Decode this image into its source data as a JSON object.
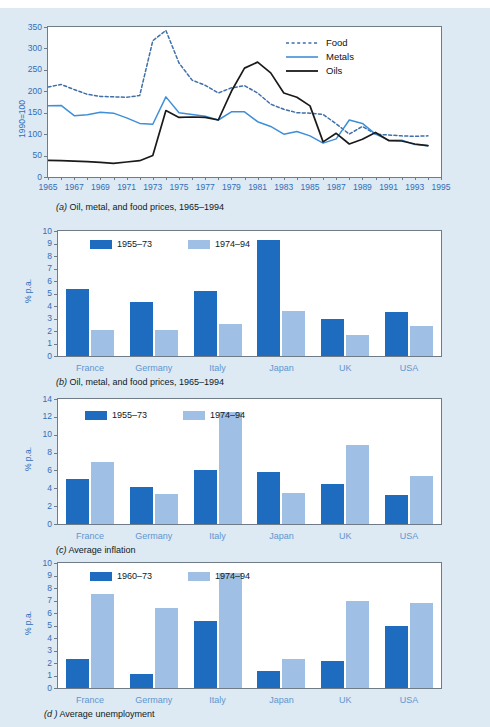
{
  "page": {
    "background_color": "#dde9f3",
    "plot_background": "#ffffff",
    "accent_dark_blue": "#1d6cc0",
    "accent_light_blue": "#9fc0e4",
    "tick_text_color": "#2f6fba",
    "category_text_color": "#5f96cf"
  },
  "figures": [
    {
      "id": "a",
      "caption_label": "(a)",
      "caption_text": "Oil, metal, and food prices, 1965–1994",
      "ylabel": "1990=100",
      "yticks": [
        "0",
        "50",
        "100",
        "150",
        "200",
        "250",
        "300",
        "350"
      ],
      "xticks": [
        "1965",
        "1967",
        "1969",
        "1971",
        "1973",
        "1975",
        "1977",
        "1979",
        "1981",
        "1983",
        "1985",
        "1987",
        "1989",
        "1991",
        "1993",
        "1995"
      ],
      "legend": [
        {
          "name": "Food",
          "style": "dashed",
          "color": "#3f6fa8"
        },
        {
          "name": "Metals",
          "style": "solid",
          "color": "#3f8fd8"
        },
        {
          "name": "Oils",
          "style": "solid",
          "color": "#1a1a1a"
        }
      ]
    },
    {
      "id": "b",
      "caption_label": "(b)",
      "caption_text": "Oil, metal, and food prices, 1965–1994",
      "ylabel": "% p.a.",
      "yticks": [
        "0",
        "1",
        "2",
        "3",
        "4",
        "5",
        "6",
        "7",
        "8",
        "9",
        "10"
      ],
      "legend": [
        "1955–73",
        "1974–94"
      ],
      "categories": [
        "France",
        "Germany",
        "Italy",
        "Japan",
        "UK",
        "USA"
      ]
    },
    {
      "id": "c",
      "caption_label": "(c)",
      "caption_text": "Average inflation",
      "ylabel": "% p.a.",
      "yticks": [
        "0",
        "2",
        "4",
        "6",
        "8",
        "10",
        "12",
        "14"
      ],
      "legend": [
        "1955–73",
        "1974–94"
      ],
      "categories": [
        "France",
        "Germany",
        "Italy",
        "Japan",
        "UK",
        "USA"
      ]
    },
    {
      "id": "d",
      "caption_label": "(d )",
      "caption_text": "Average unemployment",
      "ylabel": "% p.a.",
      "yticks": [
        "0",
        "1",
        "2",
        "3",
        "4",
        "5",
        "6",
        "7",
        "8",
        "9",
        "10"
      ],
      "legend": [
        "1960–73",
        "1974–94"
      ],
      "categories": [
        "France",
        "Germany",
        "Italy",
        "Japan",
        "UK",
        "USA"
      ]
    }
  ],
  "chart_data": [
    {
      "type": "line",
      "title": "(a) Oil, metal, and food prices, 1965–1994",
      "xlabel": "",
      "ylabel": "1990=100",
      "xlim": [
        1965,
        1995
      ],
      "ylim": [
        0,
        350
      ],
      "grid": false,
      "legend_position": "top-right",
      "x": [
        1965,
        1966,
        1967,
        1968,
        1969,
        1970,
        1971,
        1972,
        1973,
        1974,
        1975,
        1976,
        1977,
        1978,
        1979,
        1980,
        1981,
        1982,
        1983,
        1984,
        1985,
        1986,
        1987,
        1988,
        1989,
        1990,
        1991,
        1992,
        1993,
        1994
      ],
      "series": [
        {
          "name": "Food",
          "style": "dashed",
          "color": "#3f6fa8",
          "values": [
            210,
            216,
            204,
            193,
            188,
            187,
            186,
            190,
            318,
            342,
            266,
            226,
            214,
            196,
            208,
            213,
            196,
            170,
            158,
            150,
            149,
            146,
            124,
            100,
            118,
            100,
            98,
            96,
            95,
            96
          ]
        },
        {
          "name": "Metals",
          "style": "solid",
          "color": "#3f8fd8",
          "values": [
            166,
            167,
            143,
            145,
            151,
            149,
            138,
            125,
            123,
            187,
            150,
            146,
            142,
            133,
            152,
            152,
            129,
            118,
            100,
            106,
            96,
            79,
            89,
            133,
            125,
            100,
            86,
            86,
            76,
            73
          ]
        },
        {
          "name": "Oils",
          "style": "solid",
          "color": "#1a1a1a",
          "values": [
            39,
            38,
            37,
            36,
            34,
            32,
            35,
            38,
            50,
            155,
            139,
            140,
            139,
            133,
            200,
            254,
            268,
            243,
            196,
            186,
            166,
            82,
            102,
            77,
            88,
            104,
            85,
            84,
            77,
            73
          ]
        }
      ]
    },
    {
      "type": "bar",
      "title": "(b) Oil, metal, and food prices, 1965–1994",
      "xlabel": "",
      "ylabel": "% p.a.",
      "ylim": [
        0,
        10
      ],
      "grid": false,
      "legend_position": "top-left",
      "categories": [
        "France",
        "Germany",
        "Italy",
        "Japan",
        "UK",
        "USA"
      ],
      "series": [
        {
          "name": "1955–73",
          "color": "#1d6cc0",
          "values": [
            5.4,
            4.3,
            5.2,
            9.3,
            3.0,
            3.5
          ]
        },
        {
          "name": "1974–94",
          "color": "#9fc0e4",
          "values": [
            2.1,
            2.1,
            2.6,
            3.6,
            1.7,
            2.4
          ]
        }
      ]
    },
    {
      "type": "bar",
      "title": "(c) Average inflation",
      "xlabel": "",
      "ylabel": "% p.a.",
      "ylim": [
        0,
        14
      ],
      "grid": false,
      "legend_position": "top-left",
      "categories": [
        "France",
        "Germany",
        "Italy",
        "Japan",
        "UK",
        "USA"
      ],
      "series": [
        {
          "name": "1955–73",
          "color": "#1d6cc0",
          "values": [
            5.1,
            4.2,
            6.0,
            5.8,
            4.5,
            3.2
          ]
        },
        {
          "name": "1974–94",
          "color": "#9fc0e4",
          "values": [
            6.9,
            3.4,
            12.5,
            3.5,
            8.9,
            5.4
          ]
        }
      ]
    },
    {
      "type": "bar",
      "title": "(d) Average unemployment",
      "xlabel": "",
      "ylabel": "% p.a.",
      "ylim": [
        0,
        10
      ],
      "grid": false,
      "legend_position": "top-left",
      "categories": [
        "France",
        "Germany",
        "Italy",
        "Japan",
        "UK",
        "USA"
      ],
      "series": [
        {
          "name": "1960–73",
          "color": "#1d6cc0",
          "values": [
            2.3,
            1.1,
            5.4,
            1.4,
            2.2,
            5.0
          ]
        },
        {
          "name": "1974–94",
          "color": "#9fc0e4",
          "values": [
            7.5,
            6.4,
            9.2,
            2.35,
            7.0,
            6.8
          ]
        }
      ]
    }
  ]
}
